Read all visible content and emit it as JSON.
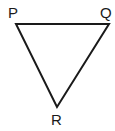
{
  "diagram": {
    "type": "triangle",
    "stroke_color": "#1a1a1a",
    "background": "#ffffff",
    "vertices": [
      {
        "label": "P",
        "x": 16,
        "y": 24,
        "label_x": 8,
        "label_y": 18
      },
      {
        "label": "Q",
        "x": 109,
        "y": 24,
        "label_x": 100,
        "label_y": 18
      },
      {
        "label": "R",
        "x": 57,
        "y": 107,
        "label_x": 51,
        "label_y": 125
      }
    ],
    "edges": [
      {
        "from": "P",
        "to": "Q"
      },
      {
        "from": "Q",
        "to": "R"
      },
      {
        "from": "R",
        "to": "P"
      }
    ]
  }
}
